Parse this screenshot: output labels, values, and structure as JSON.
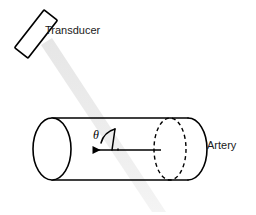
{
  "figure": {
    "background_color": "#ffffff",
    "width": 256,
    "height": 215
  },
  "labels": {
    "transducer": "Transducer",
    "artery": "Artery",
    "angle": "θ"
  },
  "colors": {
    "outline": "#000000",
    "text": "#1a1a1a",
    "beam": "#ececec",
    "beam_edge": "#e3e3e3",
    "fill": "#ffffff"
  },
  "geometry": {
    "transducer": {
      "shape": "rotated-rectangle",
      "center_x": 36,
      "center_y": 34,
      "width": 17,
      "height": 48,
      "rotation_deg": 38
    },
    "beam": {
      "shape": "band",
      "start_x": 48,
      "start_y": 50,
      "end_x": 160,
      "end_y": 212,
      "thickness": 11,
      "angle_deg": 55
    },
    "cylinder": {
      "left_cap_center_x": 52,
      "left_cap_center_y": 149,
      "cap_rx": 19,
      "cap_ry": 31,
      "right_x": 188,
      "top_y": 118,
      "bottom_y": 180,
      "dashed_cap_center_x": 170,
      "dashed_cap_rx": 16
    },
    "flow_arrow": {
      "tail_x": 161,
      "head_x": 89,
      "y": 150,
      "direction": "left"
    },
    "angle_arc": {
      "vertex_x": 118,
      "vertex_y": 150,
      "radius": 22
    }
  }
}
